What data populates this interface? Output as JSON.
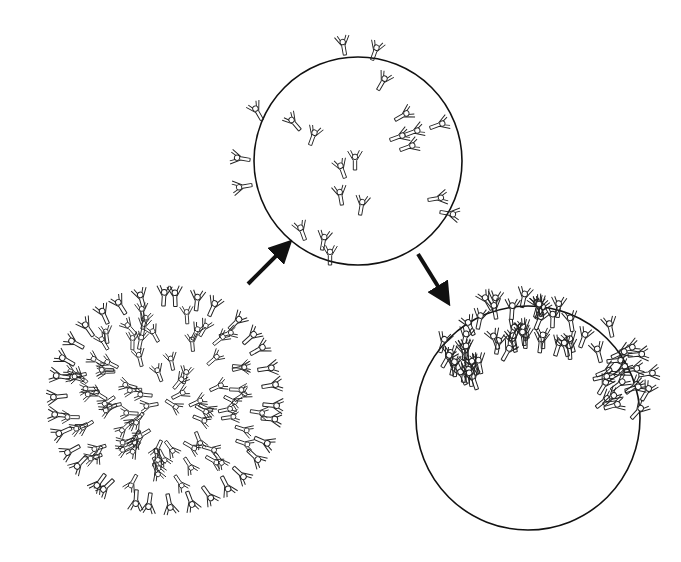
{
  "diagram": {
    "type": "line-art illustration",
    "background": "#ffffff",
    "stroke_color": "#111111",
    "panels": [
      {
        "id": "cell-coated",
        "description": "cell densely covered with Y-shaped antibodies",
        "cx": 165,
        "cy": 400,
        "r": 108,
        "antibody_count": 120,
        "mode": "coated"
      },
      {
        "id": "cell-dispersed",
        "description": "cell with scattered antibodies bound to surface",
        "cx": 358,
        "cy": 161,
        "r": 104,
        "antibody_count": 26,
        "mode": "scattered"
      },
      {
        "id": "cell-capped",
        "description": "cell with antibodies clustered into a cap on one pole",
        "cx": 528,
        "cy": 418,
        "r": 112,
        "antibody_count": 70,
        "mode": "cap"
      }
    ],
    "arrows": [
      {
        "id": "arrow-1",
        "from": [
          248,
          284
        ],
        "to": [
          284,
          248
        ]
      },
      {
        "id": "arrow-2",
        "from": [
          418,
          254
        ],
        "to": [
          444,
          296
        ]
      }
    ]
  }
}
